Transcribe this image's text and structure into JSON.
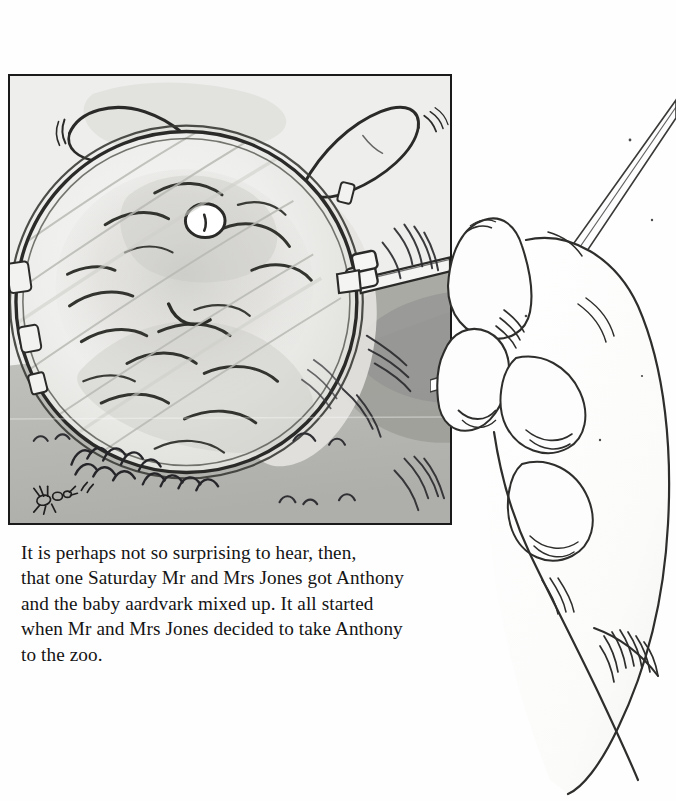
{
  "page": {
    "kind": "picture-book-page",
    "background_color": "#ffffff",
    "width": 676,
    "height": 801
  },
  "illustration_panel": {
    "label": "Framed pencil-and-wash illustration",
    "frame_color": "#1a1a1a",
    "paper_color": "#e9e9e7",
    "ground_color": "#b4b4b0",
    "shadow_color": "#8f8f8c",
    "subject": "A magnifying glass held over the face of a baby aardvark lying on the ground",
    "elements": [
      {
        "name": "magnifying-glass-lens",
        "description": "Large circular lens filling most of the panel"
      },
      {
        "name": "magnifying-glass-rim",
        "description": "Thin double-line metal rim around the lens"
      },
      {
        "name": "magnifying-glass-handle",
        "description": "Handle entering from the right edge with a hinge collar"
      },
      {
        "name": "aardvark-head",
        "description": "Baby aardvark snout and head seen magnified through the lens"
      },
      {
        "name": "aardvark-ear-left",
        "description": "Long rabbit-like ear at upper left"
      },
      {
        "name": "aardvark-ear-right",
        "description": "Long rabbit-like ear at upper right"
      },
      {
        "name": "aardvark-eye",
        "description": "Small round white eye near the centre of the lens"
      },
      {
        "name": "grass-tufts",
        "description": "Sketched grass tufts along the lower edge"
      },
      {
        "name": "ant",
        "description": "Tiny ant drawn at lower left on the ground"
      }
    ]
  },
  "hand_illustration": {
    "label": "Line drawing of a hand gripping the magnifying glass handle",
    "line_color": "#2b2b2b",
    "fill_color": "#fdfdfd",
    "elements": [
      {
        "name": "thumb",
        "description": "Thumb pressing across the handle"
      },
      {
        "name": "index-finger",
        "description": "Index finger wrapped over the handle"
      },
      {
        "name": "middle-finger",
        "description": "Middle finger curled beneath"
      },
      {
        "name": "magnifier-handle-shaft",
        "description": "Two parallel lines of the handle running to upper right"
      },
      {
        "name": "wrist",
        "description": "Wrist and forearm sweeping to the lower right with cuff hatching"
      }
    ]
  },
  "body_text": {
    "paragraph": "It is perhaps not so surprising to hear, then,\nthat one Saturday Mr and Mrs Jones got Anthony\nand the baby aardvark mixed up. It all started\nwhen Mr and Mrs Jones decided to take Anthony\nto the zoo.",
    "lines": [
      "It is perhaps not so surprising to hear, then,",
      "that one Saturday Mr and Mrs Jones got Anthony",
      "and the baby aardvark mixed up. It all started",
      "when Mr and Mrs Jones decided to take Anthony",
      "to the zoo."
    ],
    "text_color": "#141414"
  }
}
